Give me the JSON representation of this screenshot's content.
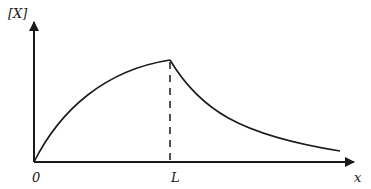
{
  "diagram": {
    "y_axis_label": "[X]",
    "x_axis_label": "x",
    "tick_labels": {
      "origin": "0",
      "peak_position": "L"
    },
    "curve": {
      "description": "Concentration [X] rises concavely from 0 at x=0 to a maximum at x=L, then decays toward zero for x>L",
      "rising_segment": "0 to L",
      "decaying_segment": "L to end"
    },
    "marker_line": {
      "at": "L",
      "style": "dashed vertical"
    },
    "colors": {
      "stroke": "#1a1a1a",
      "background": "#ffffff"
    }
  }
}
